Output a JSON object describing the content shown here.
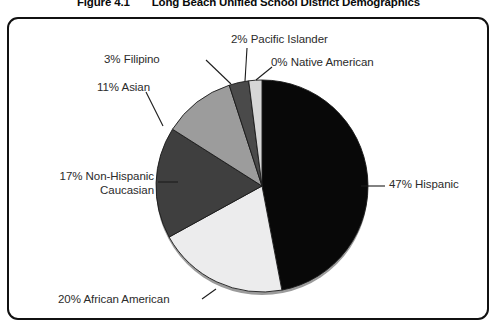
{
  "figure": {
    "number": "Figure 4.1",
    "title": "Long Beach Unified School District Demographics"
  },
  "chart_data": {
    "type": "pie",
    "title": "Long Beach Unified School District Demographics",
    "xlabel": "",
    "ylabel": "",
    "legend_position": "none",
    "grid": false,
    "labels_outside": true,
    "units": "percent",
    "categories": [
      "Hispanic",
      "African American",
      "Non-Hispanic Caucasian",
      "Asian",
      "Filipino",
      "Pacific Islander",
      "Native American"
    ],
    "values": [
      47,
      20,
      17,
      11,
      3,
      2,
      0
    ],
    "colors": [
      "#080808",
      "#ececed",
      "#3f3f3f",
      "#9c9c9c",
      "#4a4a4a",
      "#d6d6d6",
      "#080808"
    ],
    "slices": [
      {
        "label": "47% Hispanic",
        "name": "Hispanic",
        "value": 47,
        "color": "#080808"
      },
      {
        "label": "20% African American",
        "name": "African American",
        "value": 20,
        "color": "#ececed"
      },
      {
        "label": "17% Non-Hispanic Caucasian",
        "name": "Non-Hispanic Caucasian",
        "value": 17,
        "color": "#3f3f3f"
      },
      {
        "label": "11% Asian",
        "name": "Asian",
        "value": 11,
        "color": "#9c9c9c"
      },
      {
        "label": "3% Filipino",
        "name": "Filipino",
        "value": 3,
        "color": "#4a4a4a"
      },
      {
        "label": "2% Pacific Islander",
        "name": "Pacific Islander",
        "value": 2,
        "color": "#d6d6d6"
      },
      {
        "label": "0% Native American",
        "name": "Native American",
        "value": 0,
        "color": "#080808"
      }
    ]
  },
  "labels": {
    "hispanic": "47% Hispanic",
    "african_american": "20% African American",
    "caucasian_line1": "17% Non-Hispanic",
    "caucasian_line2": "Caucasian",
    "asian": "11% Asian",
    "filipino": "3% Filipino",
    "pacific_islander": "2% Pacific Islander",
    "native_american": "0% Native American"
  }
}
